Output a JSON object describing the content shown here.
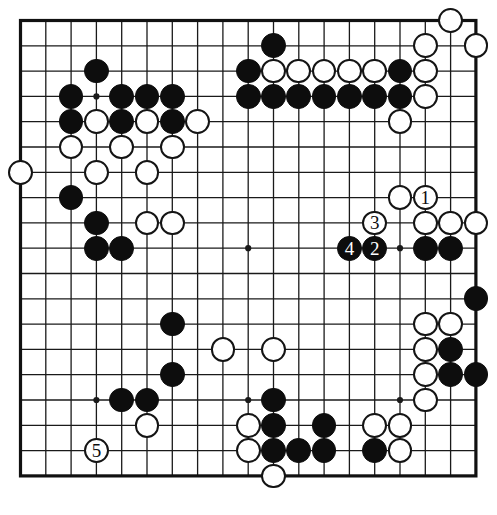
{
  "board": {
    "kind": "go-board",
    "size": 19,
    "origin_x": 20.5,
    "origin_y": 20.5,
    "spacing": 25.3,
    "stone_radius": 12.4,
    "line_color": "#1a1a1a",
    "border_color": "#111111",
    "background_color": "#ffffff",
    "black_color": "#0d0d0d",
    "white_color": "#ffffff",
    "star_points": [
      {
        "col": 4,
        "row": 4
      },
      {
        "col": 10,
        "row": 4
      },
      {
        "col": 16,
        "row": 4
      },
      {
        "col": 4,
        "row": 10
      },
      {
        "col": 10,
        "row": 10
      },
      {
        "col": 16,
        "row": 10
      },
      {
        "col": 4,
        "row": 16
      },
      {
        "col": 10,
        "row": 16
      },
      {
        "col": 16,
        "row": 16
      }
    ],
    "stones": [
      {
        "col": 18,
        "row": 1,
        "color": "white",
        "label": ""
      },
      {
        "col": 11,
        "row": 2,
        "color": "black",
        "label": ""
      },
      {
        "col": 17,
        "row": 2,
        "color": "white",
        "label": ""
      },
      {
        "col": 19,
        "row": 2,
        "color": "white",
        "label": ""
      },
      {
        "col": 4,
        "row": 3,
        "color": "black",
        "label": ""
      },
      {
        "col": 10,
        "row": 3,
        "color": "black",
        "label": ""
      },
      {
        "col": 11,
        "row": 3,
        "color": "white",
        "label": ""
      },
      {
        "col": 12,
        "row": 3,
        "color": "white",
        "label": ""
      },
      {
        "col": 13,
        "row": 3,
        "color": "white",
        "label": ""
      },
      {
        "col": 14,
        "row": 3,
        "color": "white",
        "label": ""
      },
      {
        "col": 15,
        "row": 3,
        "color": "white",
        "label": ""
      },
      {
        "col": 16,
        "row": 3,
        "color": "black",
        "label": ""
      },
      {
        "col": 17,
        "row": 3,
        "color": "white",
        "label": ""
      },
      {
        "col": 3,
        "row": 4,
        "color": "black",
        "label": ""
      },
      {
        "col": 5,
        "row": 4,
        "color": "black",
        "label": ""
      },
      {
        "col": 6,
        "row": 4,
        "color": "black",
        "label": ""
      },
      {
        "col": 7,
        "row": 4,
        "color": "black",
        "label": ""
      },
      {
        "col": 10,
        "row": 4,
        "color": "black",
        "label": ""
      },
      {
        "col": 11,
        "row": 4,
        "color": "black",
        "label": ""
      },
      {
        "col": 12,
        "row": 4,
        "color": "black",
        "label": ""
      },
      {
        "col": 13,
        "row": 4,
        "color": "black",
        "label": ""
      },
      {
        "col": 14,
        "row": 4,
        "color": "black",
        "label": ""
      },
      {
        "col": 15,
        "row": 4,
        "color": "black",
        "label": ""
      },
      {
        "col": 16,
        "row": 4,
        "color": "black",
        "label": ""
      },
      {
        "col": 17,
        "row": 4,
        "color": "white",
        "label": ""
      },
      {
        "col": 3,
        "row": 5,
        "color": "black",
        "label": ""
      },
      {
        "col": 4,
        "row": 5,
        "color": "white",
        "label": ""
      },
      {
        "col": 5,
        "row": 5,
        "color": "black",
        "label": ""
      },
      {
        "col": 6,
        "row": 5,
        "color": "white",
        "label": ""
      },
      {
        "col": 7,
        "row": 5,
        "color": "black",
        "label": ""
      },
      {
        "col": 8,
        "row": 5,
        "color": "white",
        "label": ""
      },
      {
        "col": 16,
        "row": 5,
        "color": "white",
        "label": ""
      },
      {
        "col": 3,
        "row": 6,
        "color": "white",
        "label": ""
      },
      {
        "col": 5,
        "row": 6,
        "color": "white",
        "label": ""
      },
      {
        "col": 7,
        "row": 6,
        "color": "white",
        "label": ""
      },
      {
        "col": 1,
        "row": 7,
        "color": "white",
        "label": ""
      },
      {
        "col": 4,
        "row": 7,
        "color": "white",
        "label": ""
      },
      {
        "col": 6,
        "row": 7,
        "color": "white",
        "label": ""
      },
      {
        "col": 3,
        "row": 8,
        "color": "black",
        "label": ""
      },
      {
        "col": 4,
        "row": 9,
        "color": "black",
        "label": ""
      },
      {
        "col": 6,
        "row": 9,
        "color": "white",
        "label": ""
      },
      {
        "col": 7,
        "row": 9,
        "color": "white",
        "label": ""
      },
      {
        "col": 17,
        "row": 9,
        "color": "white",
        "label": ""
      },
      {
        "col": 18,
        "row": 9,
        "color": "white",
        "label": ""
      },
      {
        "col": 19,
        "row": 9,
        "color": "white",
        "label": ""
      },
      {
        "col": 15,
        "row": 9,
        "color": "white",
        "label": "3"
      },
      {
        "col": 4,
        "row": 10,
        "color": "black",
        "label": ""
      },
      {
        "col": 5,
        "row": 10,
        "color": "black",
        "label": ""
      },
      {
        "col": 14,
        "row": 10,
        "color": "black",
        "label": "4"
      },
      {
        "col": 15,
        "row": 10,
        "color": "black",
        "label": "2"
      },
      {
        "col": 17,
        "row": 10,
        "color": "black",
        "label": ""
      },
      {
        "col": 18,
        "row": 10,
        "color": "black",
        "label": ""
      },
      {
        "col": 16,
        "row": 8,
        "color": "white",
        "label": ""
      },
      {
        "col": 17,
        "row": 8,
        "color": "white",
        "label": "1"
      },
      {
        "col": 19,
        "row": 12,
        "color": "black",
        "label": ""
      },
      {
        "col": 17,
        "row": 13,
        "color": "white",
        "label": ""
      },
      {
        "col": 18,
        "row": 13,
        "color": "white",
        "label": ""
      },
      {
        "col": 7,
        "row": 13,
        "color": "black",
        "label": ""
      },
      {
        "col": 17,
        "row": 14,
        "color": "white",
        "label": ""
      },
      {
        "col": 18,
        "row": 14,
        "color": "black",
        "label": ""
      },
      {
        "col": 9,
        "row": 14,
        "color": "white",
        "label": ""
      },
      {
        "col": 11,
        "row": 14,
        "color": "white",
        "label": ""
      },
      {
        "col": 7,
        "row": 15,
        "color": "black",
        "label": ""
      },
      {
        "col": 17,
        "row": 15,
        "color": "white",
        "label": ""
      },
      {
        "col": 18,
        "row": 15,
        "color": "black",
        "label": ""
      },
      {
        "col": 19,
        "row": 15,
        "color": "black",
        "label": ""
      },
      {
        "col": 5,
        "row": 16,
        "color": "black",
        "label": ""
      },
      {
        "col": 6,
        "row": 16,
        "color": "black",
        "label": ""
      },
      {
        "col": 11,
        "row": 16,
        "color": "black",
        "label": ""
      },
      {
        "col": 17,
        "row": 16,
        "color": "white",
        "label": ""
      },
      {
        "col": 16,
        "row": 17,
        "color": "white",
        "label": ""
      },
      {
        "col": 6,
        "row": 17,
        "color": "white",
        "label": ""
      },
      {
        "col": 10,
        "row": 17,
        "color": "white",
        "label": ""
      },
      {
        "col": 11,
        "row": 17,
        "color": "black",
        "label": ""
      },
      {
        "col": 13,
        "row": 17,
        "color": "black",
        "label": ""
      },
      {
        "col": 15,
        "row": 17,
        "color": "white",
        "label": ""
      },
      {
        "col": 4,
        "row": 18,
        "color": "white",
        "label": "5"
      },
      {
        "col": 10,
        "row": 18,
        "color": "white",
        "label": ""
      },
      {
        "col": 11,
        "row": 18,
        "color": "black",
        "label": ""
      },
      {
        "col": 12,
        "row": 18,
        "color": "black",
        "label": ""
      },
      {
        "col": 13,
        "row": 18,
        "color": "black",
        "label": ""
      },
      {
        "col": 15,
        "row": 18,
        "color": "black",
        "label": ""
      },
      {
        "col": 16,
        "row": 18,
        "color": "white",
        "label": ""
      },
      {
        "col": 11,
        "row": 19,
        "color": "white",
        "label": ""
      }
    ],
    "move_numbers": [
      {
        "label": "1",
        "col": 17,
        "row": 8,
        "color": "white"
      },
      {
        "label": "2",
        "col": 15,
        "row": 10,
        "color": "black"
      },
      {
        "label": "3",
        "col": 15,
        "row": 9,
        "color": "white"
      },
      {
        "label": "4",
        "col": 14,
        "row": 10,
        "color": "black"
      },
      {
        "label": "5",
        "col": 4,
        "row": 18,
        "color": "white"
      }
    ]
  }
}
